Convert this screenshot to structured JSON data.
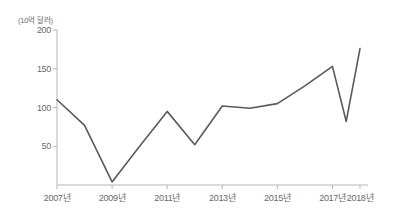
{
  "chart_data": {
    "type": "line",
    "title": "",
    "subtitle": "",
    "unit_label": "(10억 달러)",
    "xlabel": "",
    "ylabel": "",
    "ylim": [
      0,
      200
    ],
    "xlim": [
      2007,
      2018
    ],
    "grid": false,
    "legend": null,
    "y_ticks": [
      0,
      50,
      100,
      150,
      200
    ],
    "y_tick_labels": [
      "",
      "50",
      "100",
      "150",
      "200"
    ],
    "x_ticks": [
      2007,
      2009,
      2011,
      2013,
      2015,
      2017,
      2018
    ],
    "x_tick_labels": [
      "2007년",
      "2009년",
      "2011년",
      "2013년",
      "2015년",
      "2017년",
      "2018년"
    ],
    "line_color": "#5a5a5a",
    "axis_color": "#b5b5b5",
    "x": [
      2007,
      2008,
      2009,
      2010,
      2011,
      2012,
      2013,
      2014,
      2015,
      2016,
      2017,
      2017.5,
      2018
    ],
    "values": [
      110,
      77,
      4,
      50,
      95,
      52,
      102,
      99,
      105,
      128,
      153,
      82,
      176
    ],
    "series": [
      {
        "name": "",
        "values": [
          110,
          77,
          4,
          50,
          95,
          52,
          102,
          99,
          105,
          128,
          153,
          82,
          176
        ]
      }
    ]
  }
}
